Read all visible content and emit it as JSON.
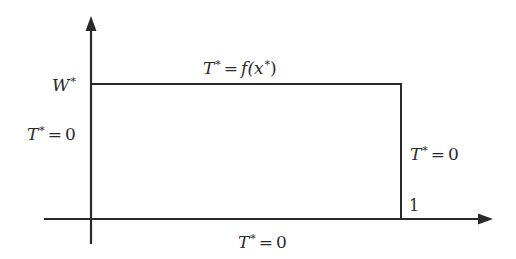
{
  "diagram": {
    "axes": {
      "y_axis": {
        "label": "W*",
        "arrow": "up"
      },
      "x_axis": {
        "tick_label": "1",
        "arrow": "right"
      }
    },
    "boundaries": {
      "top": {
        "var": "T",
        "sup": "*",
        "eq": "=",
        "rhs": "f(x",
        "rhs_sup": "*",
        "rhs_close": ")",
        "full_text": "T* = f(x*)"
      },
      "left": {
        "var": "T",
        "sup": "*",
        "eq": "=",
        "rhs": "0",
        "full_text": "T* = 0"
      },
      "right": {
        "var": "T",
        "sup": "*",
        "eq": "=",
        "rhs": "0",
        "full_text": "T* = 0"
      },
      "bottom": {
        "var": "T",
        "sup": "*",
        "eq": "=",
        "rhs": "0",
        "full_text": "T* = 0"
      }
    },
    "labels": {
      "w_star": {
        "var": "W",
        "sup": "*"
      },
      "x_one": "1"
    },
    "colors": {
      "line": "#2a2a2a",
      "text": "#2a2a2a",
      "background": "#ffffff"
    }
  }
}
